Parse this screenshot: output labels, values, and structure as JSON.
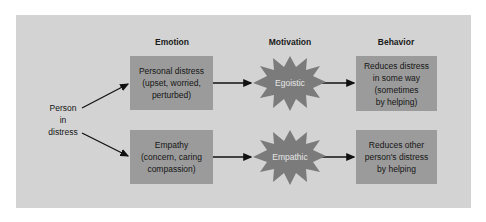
{
  "headers": {
    "emotion": "Emotion",
    "motivation": "Motivation",
    "behavior": "Behavior"
  },
  "source": {
    "lines": [
      "Person",
      "in",
      "distress"
    ]
  },
  "rows": [
    {
      "emotion": {
        "lines": [
          "Personal distress",
          "(upset, worried,",
          "perturbed)"
        ]
      },
      "motivation": "Egoistic",
      "behavior": {
        "lines": [
          "Reduces distress",
          "in some way",
          "(sometimes",
          "by helping)"
        ]
      }
    },
    {
      "emotion": {
        "lines": [
          "Empathy",
          "(concern, caring",
          "compassion)"
        ]
      },
      "motivation": "Empathic",
      "behavior": {
        "lines": [
          "Reduces other",
          "person's distress",
          "by helping"
        ]
      }
    }
  ],
  "colors": {
    "panel": "#d3d3d3",
    "box": "#9b9b9b",
    "burst": "#7b7b7b",
    "arrow": "#111111"
  }
}
